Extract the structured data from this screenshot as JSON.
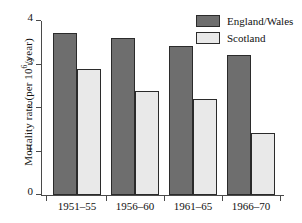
{
  "chart_data": {
    "type": "bar",
    "title": "",
    "xlabel": "",
    "ylabel": "Mortality rate (per 10^6/year)",
    "ylabel_prefix": "Mortality rate (per 10",
    "ylabel_exponent": "6",
    "ylabel_suffix": "/year)",
    "categories": [
      "1951–55",
      "1956–60",
      "1961–65",
      "1966–70"
    ],
    "series": [
      {
        "name": "England/Wales",
        "color": "#6e6e6e",
        "values": [
          3.72,
          3.62,
          3.42,
          3.22
        ]
      },
      {
        "name": "Scotland",
        "color": "#e9e9e9",
        "values": [
          2.9,
          2.4,
          2.2,
          1.43
        ]
      }
    ],
    "ylim": [
      0,
      4
    ],
    "yticks": [
      0,
      1,
      2,
      3,
      4
    ],
    "ytick_labels": [
      "0",
      "1",
      "2",
      "3",
      "4"
    ],
    "grid": false,
    "legend_position": "top-right"
  },
  "legend": {
    "entries": [
      {
        "label": "England/Wales"
      },
      {
        "label": "Scotland"
      }
    ]
  }
}
